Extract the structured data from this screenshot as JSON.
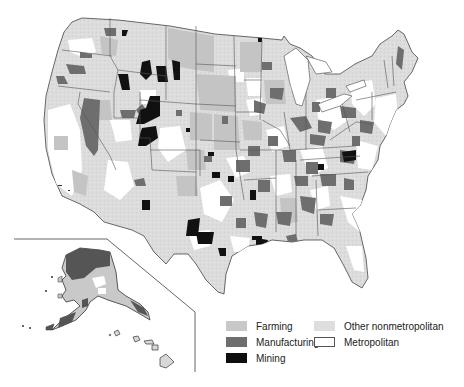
{
  "map": {
    "title": "",
    "subject": "Nonmetropolitan county economic types, United States",
    "colors": {
      "farming": "#c8c8c8",
      "manufacturing": "#6e6e6e",
      "mining": "#0e0e0e",
      "other_nonmetro": "#dedede",
      "metropolitan": "#ffffff",
      "border": "#444444"
    },
    "inset": {
      "regions": [
        "Alaska",
        "Hawaii"
      ]
    }
  },
  "legend": {
    "items": [
      {
        "key": "farming",
        "label": "Farming"
      },
      {
        "key": "manufacturing",
        "label": "Manufacturing"
      },
      {
        "key": "mining",
        "label": "Mining"
      },
      {
        "key": "other_nonmetro",
        "label": "Other nonmetropolitan"
      },
      {
        "key": "metropolitan",
        "label": "Metropolitan"
      }
    ]
  }
}
